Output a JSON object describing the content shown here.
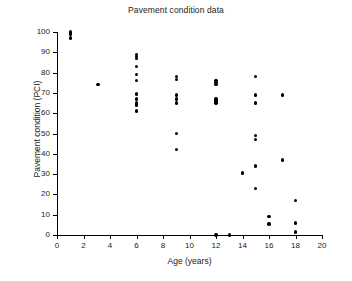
{
  "chart_data": {
    "type": "scatter",
    "title": "Pavement condition data",
    "xlabel": "Age (years)",
    "ylabel": "Pavement condition (PCI)",
    "xlim": [
      0,
      20
    ],
    "ylim": [
      0,
      100
    ],
    "xticks": [
      0,
      2,
      4,
      6,
      8,
      10,
      12,
      14,
      16,
      18,
      20
    ],
    "yticks": [
      0,
      10,
      20,
      30,
      40,
      50,
      60,
      70,
      80,
      90,
      100
    ],
    "grid": false,
    "legend": null,
    "marker": "filled-circle",
    "marker_color": "#000000",
    "x": [
      1,
      1,
      1,
      1,
      3.1,
      6,
      6,
      6,
      6,
      6,
      6,
      6,
      6,
      6,
      6,
      6,
      9,
      9,
      9,
      9,
      9,
      9,
      9,
      12,
      12,
      12,
      12,
      12,
      12,
      12,
      13,
      14,
      15,
      15,
      15,
      15,
      15,
      15,
      15,
      16,
      16,
      17,
      17,
      18,
      18,
      18
    ],
    "y": [
      100,
      99.5,
      99,
      97,
      74,
      89,
      88,
      87,
      83,
      79,
      76,
      69.5,
      67,
      65,
      64,
      61,
      78,
      76.5,
      69,
      67,
      65,
      50,
      42,
      76,
      75,
      74,
      67,
      66,
      65,
      0,
      0,
      30.5,
      78,
      69,
      65,
      49,
      47,
      34,
      23,
      9,
      5.5,
      69,
      37,
      17,
      6,
      1.5
    ],
    "points": [
      {
        "x": 1,
        "y": 100
      },
      {
        "x": 1,
        "y": 99.5
      },
      {
        "x": 1,
        "y": 99
      },
      {
        "x": 1,
        "y": 97
      },
      {
        "x": 3.1,
        "y": 74
      },
      {
        "x": 6,
        "y": 89
      },
      {
        "x": 6,
        "y": 88
      },
      {
        "x": 6,
        "y": 87
      },
      {
        "x": 6,
        "y": 83
      },
      {
        "x": 6,
        "y": 79
      },
      {
        "x": 6,
        "y": 76
      },
      {
        "x": 6,
        "y": 69.5
      },
      {
        "x": 6,
        "y": 67
      },
      {
        "x": 6,
        "y": 65
      },
      {
        "x": 6,
        "y": 64
      },
      {
        "x": 6,
        "y": 61
      },
      {
        "x": 9,
        "y": 78
      },
      {
        "x": 9,
        "y": 76.5
      },
      {
        "x": 9,
        "y": 69
      },
      {
        "x": 9,
        "y": 67
      },
      {
        "x": 9,
        "y": 65
      },
      {
        "x": 9,
        "y": 50
      },
      {
        "x": 9,
        "y": 42
      },
      {
        "x": 12,
        "y": 76
      },
      {
        "x": 12,
        "y": 75
      },
      {
        "x": 12,
        "y": 74
      },
      {
        "x": 12,
        "y": 67
      },
      {
        "x": 12,
        "y": 66
      },
      {
        "x": 12,
        "y": 65
      },
      {
        "x": 12,
        "y": 0
      },
      {
        "x": 13,
        "y": 0
      },
      {
        "x": 14,
        "y": 30.5
      },
      {
        "x": 15,
        "y": 78
      },
      {
        "x": 15,
        "y": 69
      },
      {
        "x": 15,
        "y": 65
      },
      {
        "x": 15,
        "y": 49
      },
      {
        "x": 15,
        "y": 47
      },
      {
        "x": 15,
        "y": 34
      },
      {
        "x": 15,
        "y": 23
      },
      {
        "x": 16,
        "y": 9
      },
      {
        "x": 16,
        "y": 5.5
      },
      {
        "x": 17,
        "y": 69
      },
      {
        "x": 17,
        "y": 37
      },
      {
        "x": 18,
        "y": 17
      },
      {
        "x": 18,
        "y": 6
      },
      {
        "x": 18,
        "y": 1.5
      }
    ]
  }
}
